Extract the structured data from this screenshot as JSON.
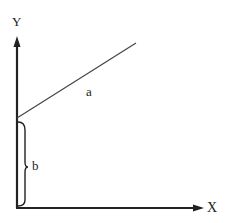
{
  "diagram": {
    "type": "linear-graph",
    "axes": {
      "y_label": "Y",
      "x_label": "X"
    },
    "line": {
      "slope_label": "a",
      "start": [
        17,
        118
      ],
      "end": [
        136,
        43
      ]
    },
    "intercept": {
      "label": "b"
    },
    "colors": {
      "axis": "#222222",
      "line": "#444444",
      "background": "#ffffff"
    }
  }
}
